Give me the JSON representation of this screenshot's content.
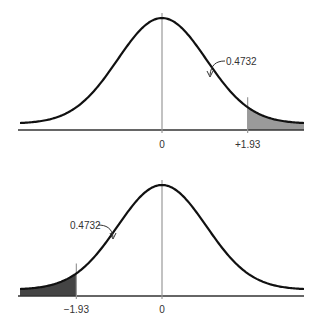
{
  "chart_data": [
    {
      "type": "area",
      "title": "",
      "distribution": "standard normal",
      "x_range": [
        -3.2,
        3.2
      ],
      "center_label": "0",
      "cutoff": 1.93,
      "cutoff_label": "+1.93",
      "shaded_tail": "right",
      "area_annotation": "0.4732",
      "annotation_side": "right",
      "colors": {
        "curve": "#111111",
        "shade": "#9a9a9a",
        "axis": "#333333",
        "guide": "#999999"
      }
    },
    {
      "type": "area",
      "title": "",
      "distribution": "standard normal",
      "x_range": [
        -3.2,
        3.2
      ],
      "center_label": "0",
      "cutoff": -1.93,
      "cutoff_label": "−1.93",
      "shaded_tail": "left",
      "area_annotation": "0.4732",
      "annotation_side": "left",
      "colors": {
        "curve": "#111111",
        "shade": "#444444",
        "axis": "#333333",
        "guide": "#999999"
      }
    }
  ]
}
